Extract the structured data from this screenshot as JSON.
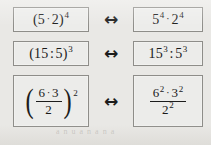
{
  "figure": {
    "name": "power-rules-equivalence-figure",
    "background_color": "#e9e8e5",
    "box_border_color": "#8e8d89",
    "box_fill_color": "#ececea",
    "text_color": "#1a1a1a",
    "ghost_text": "a n u a n a n a",
    "rows": [
      {
        "id": "row-product-power",
        "arrow": "↔",
        "left": {
          "label": "(5 · 2)⁴",
          "type": "power-of-product",
          "base_parts": [
            "5",
            "2"
          ],
          "operator": "·",
          "exponent": "4"
        },
        "right": {
          "label": "5⁴ · 2⁴",
          "type": "product-of-powers",
          "terms": [
            {
              "base": "5",
              "exponent": "4"
            },
            {
              "base": "2",
              "exponent": "4"
            }
          ],
          "operator": "·"
        }
      },
      {
        "id": "row-quotient-power",
        "arrow": "↔",
        "left": {
          "label": "(15 : 5)³",
          "type": "power-of-quotient",
          "base_parts": [
            "15",
            "5"
          ],
          "operator": ":",
          "exponent": "3"
        },
        "right": {
          "label": "15³ : 5³",
          "type": "quotient-of-powers",
          "terms": [
            {
              "base": "15",
              "exponent": "3"
            },
            {
              "base": "5",
              "exponent": "3"
            }
          ],
          "operator": ":"
        }
      },
      {
        "id": "row-fraction-power",
        "arrow": "↔",
        "left": {
          "label": "((6 · 3) / 2)²",
          "type": "power-of-fraction",
          "open_paren": "(",
          "close_paren": ")",
          "numerator": {
            "terms": [
              "6",
              "3"
            ],
            "operator": "·"
          },
          "denominator": "2",
          "exponent": "2"
        },
        "right": {
          "label": "(6² · 3²) / 2²",
          "type": "fraction-of-powers",
          "numerator": {
            "terms": [
              {
                "base": "6",
                "exponent": "2"
              },
              {
                "base": "3",
                "exponent": "2"
              }
            ],
            "operator": "·"
          },
          "denominator": {
            "base": "2",
            "exponent": "2"
          }
        }
      }
    ]
  }
}
